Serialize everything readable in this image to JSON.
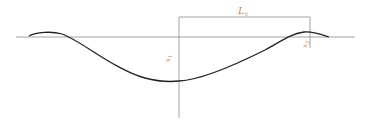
{
  "diagram": {
    "labels": {
      "length": "L",
      "length_sub": "0",
      "x1": "x",
      "x1_sub": "1",
      "x2": "x",
      "x2_sub": "2"
    },
    "colors": {
      "curve": "#222222",
      "axis": "#777777",
      "label": "#c98a55"
    }
  }
}
